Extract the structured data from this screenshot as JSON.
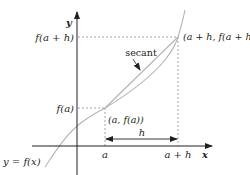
{
  "diagram": {
    "type": "secant-line-graph",
    "axes": {
      "x_label": "x",
      "y_label": "y"
    },
    "curve": {
      "label": "y = f(x)",
      "color": "#b3b3b3"
    },
    "secant": {
      "label": "secant",
      "color": "#b3b3b3"
    },
    "points": {
      "p1": {
        "label": "(a, f(a))"
      },
      "p2": {
        "label": "(a + h, f(a + h)"
      }
    },
    "y_ticks": {
      "f_a_plus_h": "f(a + h)",
      "f_a": "f(a)"
    },
    "x_ticks": {
      "a": "a",
      "a_plus_h": "a + h"
    },
    "interval": {
      "label": "h"
    },
    "colors": {
      "axis": "#231f20",
      "guide_dashed": "#9a9a9a",
      "curve": "#b3b3b3",
      "text": "#231f20"
    }
  }
}
